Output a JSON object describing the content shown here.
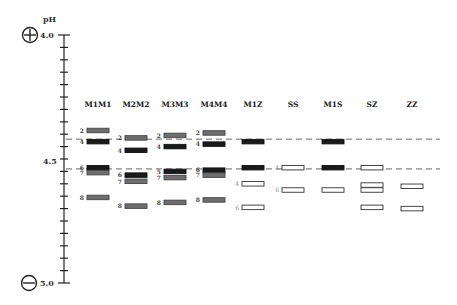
{
  "axis": {
    "title": "pH",
    "top_label": "4.0",
    "mid_label": "4.5",
    "bottom_label": "5.0",
    "range": [
      4.0,
      5.0
    ],
    "tick_step": 0.05,
    "anode_icon": "plus-circle-icon",
    "cathode_icon": "minus-circle-icon"
  },
  "reference_lines_ph": [
    4.42,
    4.54
  ],
  "colors": {
    "black_band": "#1a1a1a",
    "gray_band": "#6e6e6e",
    "open_band": "#ffffff",
    "dashed_line": "#666666"
  },
  "columns": [
    {
      "label": "M1M1",
      "bands": [
        {
          "ph": 4.385,
          "style": "gray",
          "label": "2"
        },
        {
          "ph": 4.43,
          "style": "black",
          "label": "4"
        },
        {
          "ph": 4.535,
          "style": "black",
          "label": "6"
        },
        {
          "ph": 4.555,
          "style": "gray",
          "label": "7"
        },
        {
          "ph": 4.655,
          "style": "gray",
          "label": "8"
        }
      ]
    },
    {
      "label": "M2M2",
      "bands": [
        {
          "ph": 4.415,
          "style": "gray",
          "label": "2"
        },
        {
          "ph": 4.465,
          "style": "black",
          "label": "4"
        },
        {
          "ph": 4.565,
          "style": "black",
          "label": "6"
        },
        {
          "ph": 4.59,
          "style": "gray",
          "label": "7"
        },
        {
          "ph": 4.69,
          "style": "gray",
          "label": "8"
        }
      ]
    },
    {
      "label": "M3M3",
      "bands": [
        {
          "ph": 4.405,
          "style": "gray",
          "label": "2"
        },
        {
          "ph": 4.45,
          "style": "black",
          "label": "4"
        },
        {
          "ph": 4.55,
          "style": "black",
          "label": "5"
        },
        {
          "ph": 4.575,
          "style": "gray",
          "label": "7"
        },
        {
          "ph": 4.675,
          "style": "gray",
          "label": "8"
        }
      ]
    },
    {
      "label": "M4M4",
      "bands": [
        {
          "ph": 4.395,
          "style": "gray",
          "label": "2"
        },
        {
          "ph": 4.44,
          "style": "black",
          "label": "4"
        },
        {
          "ph": 4.545,
          "style": "black",
          "label": "6"
        },
        {
          "ph": 4.565,
          "style": "gray",
          "label": "7"
        },
        {
          "ph": 4.665,
          "style": "gray",
          "label": "8"
        }
      ]
    },
    {
      "label": "M1Z",
      "bands": [
        {
          "ph": 4.43,
          "style": "black",
          "label": ""
        },
        {
          "ph": 4.535,
          "style": "black",
          "label": ""
        },
        {
          "ph": 4.6,
          "style": "open",
          "label": "4"
        },
        {
          "ph": 4.695,
          "style": "open",
          "label": "6"
        }
      ]
    },
    {
      "label": "SS",
      "bands": [
        {
          "ph": 4.535,
          "style": "open",
          "label": "4"
        },
        {
          "ph": 4.625,
          "style": "open",
          "label": "6"
        }
      ]
    },
    {
      "label": "M1S",
      "bands": [
        {
          "ph": 4.43,
          "style": "black",
          "label": ""
        },
        {
          "ph": 4.535,
          "style": "black",
          "label": ""
        },
        {
          "ph": 4.625,
          "style": "open",
          "label": ""
        }
      ]
    },
    {
      "label": "SZ",
      "bands": [
        {
          "ph": 4.535,
          "style": "open",
          "label": ""
        },
        {
          "ph": 4.605,
          "style": "open",
          "label": ""
        },
        {
          "ph": 4.625,
          "style": "open",
          "label": ""
        },
        {
          "ph": 4.695,
          "style": "open",
          "label": ""
        }
      ]
    },
    {
      "label": "ZZ",
      "bands": [
        {
          "ph": 4.61,
          "style": "open",
          "label": ""
        },
        {
          "ph": 4.7,
          "style": "open",
          "label": ""
        }
      ]
    }
  ]
}
